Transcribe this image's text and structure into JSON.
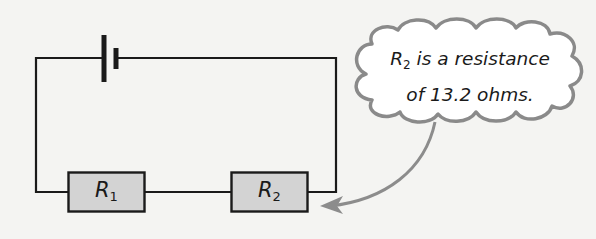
{
  "diagram": {
    "type": "series circuit",
    "components": {
      "battery": {
        "symbol": "cell"
      },
      "resistor_1": {
        "letter": "R",
        "subscript": "1"
      },
      "resistor_2": {
        "letter": "R",
        "subscript": "2"
      }
    },
    "callout": {
      "line1_letter": "R",
      "line1_subscript": "2",
      "line1_rest": " is a resistance",
      "line2": "of 13.2 ohms."
    },
    "colors": {
      "wire": "#1a1a1a",
      "resistor_fill": "#d3d3d3",
      "cloud_stroke": "#8a8a8a",
      "cloud_fill": "#ffffff",
      "arrow": "#8c8c8c",
      "background": "#f4f4f2"
    }
  }
}
